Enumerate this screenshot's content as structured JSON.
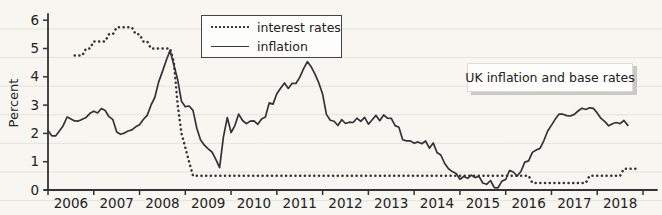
{
  "figure": {
    "ylabel": "Percent",
    "annotation_label": "UK inflation and base rates",
    "legend": {
      "interest_rates_label": "interest rates",
      "inflation_label": "inflation"
    },
    "colors": {
      "ink": "#333333",
      "paper": "#f7f6f1",
      "rule_line": "#e4e3dc",
      "note_shadow": "#c9c8c2"
    }
  },
  "chart_data": {
    "type": "line",
    "title": "UK inflation and base rates",
    "xlabel": "",
    "ylabel": "Percent",
    "xlim": [
      2006,
      2019
    ],
    "ylim": [
      0,
      6.3
    ],
    "yticks": [
      0,
      1,
      2,
      3,
      4,
      5,
      6
    ],
    "xticks": [
      2006,
      2007,
      2008,
      2009,
      2010,
      2011,
      2012,
      2013,
      2014,
      2015,
      2016,
      2017,
      2018,
      2019
    ],
    "xtick_year_labels": [
      "2006",
      "2007",
      "2008",
      "2009",
      "2010",
      "2011",
      "2012",
      "2013",
      "2014",
      "2015",
      "2016",
      "2017",
      "2018"
    ],
    "grid": false,
    "background": "ruled-paper",
    "legend_position": "top-center",
    "series": [
      {
        "name": "interest rates",
        "style": "dotted",
        "x": [
          2006.583,
          2006.667,
          2006.75,
          2006.833,
          2006.917,
          2007.0,
          2007.083,
          2007.167,
          2007.25,
          2007.333,
          2007.417,
          2007.5,
          2007.583,
          2007.667,
          2007.75,
          2007.833,
          2007.917,
          2008.0,
          2008.083,
          2008.167,
          2008.25,
          2008.333,
          2008.417,
          2008.5,
          2008.583,
          2008.667,
          2008.75,
          2008.833,
          2008.917,
          2009.0,
          2009.083,
          2009.167,
          2009.25,
          2009.333,
          2009.417,
          2009.5,
          2009.583,
          2009.667,
          2009.75,
          2009.833,
          2009.917,
          2010.0,
          2010.083,
          2010.167,
          2010.25,
          2010.333,
          2010.417,
          2010.5,
          2010.583,
          2010.667,
          2010.75,
          2010.833,
          2010.917,
          2011.0,
          2011.083,
          2011.167,
          2011.25,
          2011.333,
          2011.417,
          2011.5,
          2011.583,
          2011.667,
          2011.75,
          2011.833,
          2011.917,
          2012.0,
          2012.083,
          2012.167,
          2012.25,
          2012.333,
          2012.417,
          2012.5,
          2012.583,
          2012.667,
          2012.75,
          2012.833,
          2012.917,
          2013.0,
          2013.083,
          2013.167,
          2013.25,
          2013.333,
          2013.417,
          2013.5,
          2013.583,
          2013.667,
          2013.75,
          2013.833,
          2013.917,
          2014.0,
          2014.083,
          2014.167,
          2014.25,
          2014.333,
          2014.417,
          2014.5,
          2014.583,
          2014.667,
          2014.75,
          2014.833,
          2014.917,
          2015.0,
          2015.083,
          2015.167,
          2015.25,
          2015.333,
          2015.417,
          2015.5,
          2015.583,
          2015.667,
          2015.75,
          2015.833,
          2015.917,
          2016.0,
          2016.083,
          2016.167,
          2016.25,
          2016.333,
          2016.417,
          2016.5,
          2016.583,
          2016.667,
          2016.75,
          2016.833,
          2016.917,
          2017.0,
          2017.083,
          2017.167,
          2017.25,
          2017.333,
          2017.417,
          2017.5,
          2017.583,
          2017.667,
          2017.75,
          2017.833,
          2017.917,
          2018.0,
          2018.083,
          2018.167,
          2018.25,
          2018.333,
          2018.417,
          2018.5,
          2018.583,
          2018.667,
          2018.75,
          2018.833,
          2018.917
        ],
        "values": [
          4.75,
          4.75,
          4.75,
          5.0,
          5.0,
          5.25,
          5.25,
          5.25,
          5.25,
          5.5,
          5.5,
          5.75,
          5.75,
          5.75,
          5.75,
          5.75,
          5.5,
          5.5,
          5.25,
          5.25,
          5.0,
          5.0,
          5.0,
          5.0,
          5.0,
          5.0,
          4.5,
          3.0,
          2.0,
          1.5,
          1.0,
          0.5,
          0.5,
          0.5,
          0.5,
          0.5,
          0.5,
          0.5,
          0.5,
          0.5,
          0.5,
          0.5,
          0.5,
          0.5,
          0.5,
          0.5,
          0.5,
          0.5,
          0.5,
          0.5,
          0.5,
          0.5,
          0.5,
          0.5,
          0.5,
          0.5,
          0.5,
          0.5,
          0.5,
          0.5,
          0.5,
          0.5,
          0.5,
          0.5,
          0.5,
          0.5,
          0.5,
          0.5,
          0.5,
          0.5,
          0.5,
          0.5,
          0.5,
          0.5,
          0.5,
          0.5,
          0.5,
          0.5,
          0.5,
          0.5,
          0.5,
          0.5,
          0.5,
          0.5,
          0.5,
          0.5,
          0.5,
          0.5,
          0.5,
          0.5,
          0.5,
          0.5,
          0.5,
          0.5,
          0.5,
          0.5,
          0.5,
          0.5,
          0.5,
          0.5,
          0.5,
          0.5,
          0.5,
          0.5,
          0.5,
          0.5,
          0.5,
          0.5,
          0.5,
          0.5,
          0.5,
          0.5,
          0.5,
          0.5,
          0.5,
          0.5,
          0.5,
          0.5,
          0.5,
          0.5,
          0.25,
          0.25,
          0.25,
          0.25,
          0.25,
          0.25,
          0.25,
          0.25,
          0.25,
          0.25,
          0.25,
          0.25,
          0.25,
          0.25,
          0.25,
          0.5,
          0.5,
          0.5,
          0.5,
          0.5,
          0.5,
          0.5,
          0.5,
          0.5,
          0.75,
          0.75,
          0.75,
          0.75,
          0.75
        ]
      },
      {
        "name": "inflation",
        "style": "solid",
        "x": [
          2006.0,
          2006.083,
          2006.167,
          2006.25,
          2006.333,
          2006.417,
          2006.5,
          2006.583,
          2006.667,
          2006.75,
          2006.833,
          2006.917,
          2007.0,
          2007.083,
          2007.167,
          2007.25,
          2007.333,
          2007.417,
          2007.5,
          2007.583,
          2007.667,
          2007.75,
          2007.833,
          2007.917,
          2008.0,
          2008.083,
          2008.167,
          2008.25,
          2008.333,
          2008.417,
          2008.5,
          2008.583,
          2008.667,
          2008.75,
          2008.833,
          2008.917,
          2009.0,
          2009.083,
          2009.167,
          2009.25,
          2009.333,
          2009.417,
          2009.5,
          2009.583,
          2009.667,
          2009.75,
          2009.833,
          2009.917,
          2010.0,
          2010.083,
          2010.167,
          2010.25,
          2010.333,
          2010.417,
          2010.5,
          2010.583,
          2010.667,
          2010.75,
          2010.833,
          2010.917,
          2011.0,
          2011.083,
          2011.167,
          2011.25,
          2011.333,
          2011.417,
          2011.5,
          2011.583,
          2011.667,
          2011.75,
          2011.833,
          2011.917,
          2012.0,
          2012.083,
          2012.167,
          2012.25,
          2012.333,
          2012.417,
          2012.5,
          2012.583,
          2012.667,
          2012.75,
          2012.833,
          2012.917,
          2013.0,
          2013.083,
          2013.167,
          2013.25,
          2013.333,
          2013.417,
          2013.5,
          2013.583,
          2013.667,
          2013.75,
          2013.833,
          2013.917,
          2014.0,
          2014.083,
          2014.167,
          2014.25,
          2014.333,
          2014.417,
          2014.5,
          2014.583,
          2014.667,
          2014.75,
          2014.833,
          2014.917,
          2015.0,
          2015.083,
          2015.167,
          2015.25,
          2015.333,
          2015.417,
          2015.5,
          2015.583,
          2015.667,
          2015.75,
          2015.833,
          2015.917,
          2016.0,
          2016.083,
          2016.167,
          2016.25,
          2016.333,
          2016.417,
          2016.5,
          2016.583,
          2016.667,
          2016.75,
          2016.833,
          2016.917,
          2017.0,
          2017.083,
          2017.167,
          2017.25,
          2017.333,
          2017.417,
          2017.5,
          2017.583,
          2017.667,
          2017.75,
          2017.833,
          2017.917,
          2018.0,
          2018.083,
          2018.167,
          2018.25,
          2018.333,
          2018.417,
          2018.5,
          2018.583,
          2018.667
        ],
        "values": [
          2.1,
          1.95,
          1.9,
          2.1,
          2.3,
          2.55,
          2.5,
          2.45,
          2.4,
          2.5,
          2.6,
          2.7,
          2.8,
          2.75,
          2.85,
          2.8,
          2.6,
          2.45,
          2.05,
          2.0,
          2.0,
          2.1,
          2.15,
          2.2,
          2.3,
          2.5,
          2.6,
          3.0,
          3.3,
          3.8,
          4.2,
          4.6,
          4.9,
          4.4,
          3.9,
          3.1,
          2.95,
          3.0,
          2.8,
          2.2,
          1.8,
          1.55,
          1.45,
          1.35,
          1.05,
          0.8,
          1.9,
          2.55,
          2.05,
          2.3,
          2.65,
          2.45,
          2.35,
          2.4,
          2.45,
          2.35,
          2.5,
          2.6,
          3.1,
          3.0,
          3.4,
          3.6,
          3.75,
          3.6,
          3.8,
          3.75,
          4.0,
          4.3,
          4.5,
          4.35,
          4.1,
          3.75,
          3.4,
          2.7,
          2.45,
          2.45,
          2.3,
          2.45,
          2.35,
          2.4,
          2.35,
          2.55,
          2.45,
          2.55,
          2.35,
          2.5,
          2.6,
          2.45,
          2.65,
          2.5,
          2.55,
          2.3,
          2.2,
          1.8,
          1.75,
          1.7,
          1.65,
          1.7,
          1.6,
          1.75,
          1.5,
          1.65,
          1.35,
          1.25,
          0.9,
          0.75,
          0.65,
          0.55,
          0.4,
          0.5,
          0.4,
          0.55,
          0.45,
          0.45,
          0.25,
          0.2,
          0.3,
          0.1,
          0.1,
          0.3,
          0.4,
          0.7,
          0.6,
          0.5,
          0.65,
          0.95,
          1.05,
          1.35,
          1.4,
          1.5,
          1.75,
          2.05,
          2.3,
          2.5,
          2.65,
          2.7,
          2.65,
          2.6,
          2.7,
          2.8,
          2.85,
          2.85,
          2.9,
          2.85,
          2.75,
          2.55,
          2.4,
          2.3,
          2.35,
          2.35,
          2.35,
          2.45,
          2.25
        ]
      }
    ]
  }
}
